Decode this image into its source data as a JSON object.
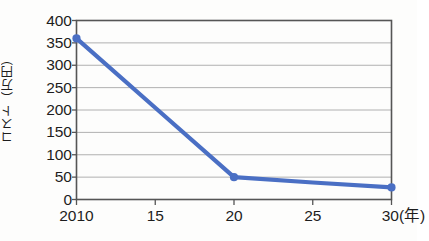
{
  "chart_data": {
    "type": "line",
    "title": "",
    "xlabel": "年",
    "xlabel_display": "(年)",
    "ylabel": "コスト（万円）",
    "x": [
      2010,
      2015,
      2020,
      2025,
      2030
    ],
    "x_tick_labels": [
      "2010",
      "15",
      "20",
      "25",
      "30"
    ],
    "values": [
      360,
      205,
      50,
      38,
      27
    ],
    "series": [
      {
        "name": "コスト",
        "values": [
          360,
          205,
          50,
          38,
          27
        ]
      }
    ],
    "markers_shown": [
      true,
      false,
      true,
      false,
      true
    ],
    "ylim": [
      0,
      400
    ],
    "ytick_labels": [
      "0",
      "50",
      "100",
      "150",
      "200",
      "250",
      "300",
      "350",
      "400"
    ],
    "ytick_values": [
      0,
      50,
      100,
      150,
      200,
      250,
      300,
      350,
      400
    ],
    "grid": true,
    "grid_axis": "y",
    "legend": "none",
    "colors": {
      "line": "#4a6fc4",
      "marker": "#4a6fc4",
      "grid": "#b0b0b0",
      "frame": "#555555",
      "text": "#1d1d1d",
      "background": "#fdfdfc"
    }
  },
  "axis": {
    "y_label_text": "コスト（万円）",
    "x_unit_text": "(年)"
  }
}
